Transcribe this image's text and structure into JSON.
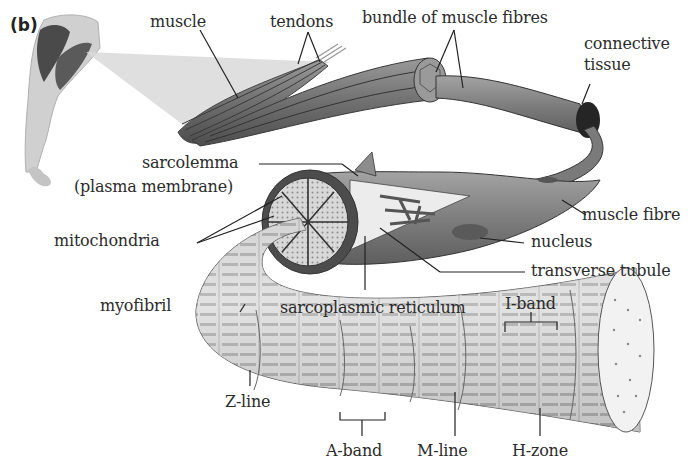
{
  "panel_label": "(b)",
  "labels": {
    "muscle": "muscle",
    "tendons": "tendons",
    "bundle": "bundle of muscle fibres",
    "connective_1": "connective",
    "connective_2": "tissue",
    "sarcolemma": "sarcolemma",
    "plasma_membrane": "(plasma membrane)",
    "mitochondria": "mitochondria",
    "muscle_fibre": "muscle fibre",
    "nucleus": "nucleus",
    "transverse_tubule": "transverse tubule",
    "myofibril": "myofibril",
    "sarcoplasmic_reticulum": "sarcoplasmic reticulum",
    "i_band": "I-band",
    "z_line": "Z-line",
    "a_band": "A-band",
    "m_line": "M-line",
    "h_zone": "H-zone"
  },
  "colors": {
    "muscle_dark": "#5a5a5a",
    "muscle_mid": "#8a8a8a",
    "fibre": "#7d7d7d",
    "myofibril_light": "#e6e6e6",
    "myofibril_dark": "#a9a9a9",
    "connective": "#2a2a2a",
    "arm": "#cfcfcf",
    "projection": "#d6d6d6"
  }
}
